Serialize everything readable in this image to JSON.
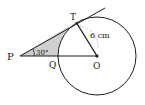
{
  "diagram": {
    "labels": {
      "P": "P",
      "Q": "Q",
      "O": "O",
      "T": "T",
      "radius": "6 cm",
      "angle": "30°"
    },
    "colors": {
      "line": "#1a1a1a",
      "shade": "#cfcfcf",
      "dotted": "#9a9a9a"
    }
  }
}
